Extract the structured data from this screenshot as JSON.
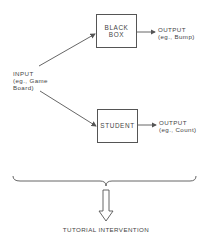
{
  "diagram": {
    "input": {
      "line1": "INPUT",
      "line2": "(eg., Game",
      "line3": "Board)"
    },
    "black_box": {
      "line1": "BLACK",
      "line2": "BOX"
    },
    "black_box_output": {
      "line1": "OUTPUT",
      "line2": "(eg., Bump)"
    },
    "student": {
      "label": "STUDENT"
    },
    "student_output": {
      "line1": "OUTPUT",
      "line2": "(eg., Count)"
    },
    "result": {
      "label": "TUTORIAL INTERVENTION"
    }
  },
  "colors": {
    "line": "#555555",
    "text": "#444444",
    "background": "#ffffff"
  }
}
